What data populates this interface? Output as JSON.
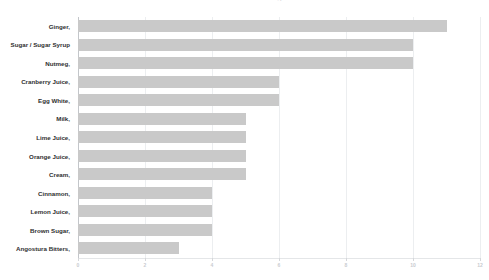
{
  "chart_data": {
    "type": "bar",
    "orientation": "horizontal",
    "title": "Most Common Cocktail Ingredients",
    "xlabel": "",
    "ylabel": "",
    "xlim": [
      0,
      12
    ],
    "xticks": [
      0,
      2,
      4,
      6,
      8,
      10,
      12
    ],
    "xticklabels": [
      "0",
      "2",
      "4",
      "6",
      "8",
      "10",
      "12"
    ],
    "grid": true,
    "grid_axis": "x",
    "legend": false,
    "bar_color": "#c9c9c9",
    "background_color": "#ffffff",
    "gridline_color": "#eceef0",
    "categories": [
      "Ginger,",
      "Sugar / Sugar Syrup",
      "Nutmeg,",
      "Cranberry Juice,",
      "Egg White,",
      "Milk,",
      "Lime Juice,",
      "Orange Juice,",
      "Cream,",
      "Cinnamon,",
      "Lemon Juice,",
      "Brown Sugar,",
      "Angostura Bitters,"
    ],
    "values": [
      11,
      10,
      10,
      6,
      6,
      5,
      5,
      5,
      5,
      4,
      4,
      4,
      3
    ]
  }
}
